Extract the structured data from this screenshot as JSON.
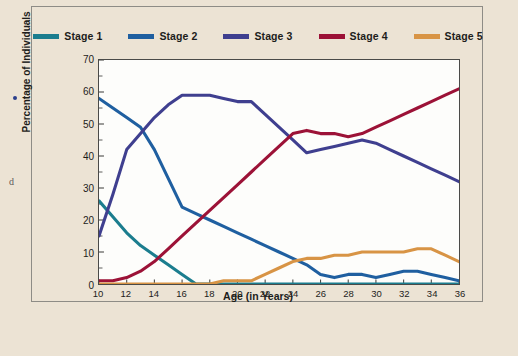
{
  "chart_data": {
    "type": "line",
    "title": "",
    "xlabel": "Age (in Years)",
    "ylabel": "Percentage of Individuals",
    "xlim": [
      10,
      36
    ],
    "ylim": [
      0,
      70
    ],
    "xticks": [
      10,
      12,
      14,
      16,
      18,
      20,
      22,
      24,
      26,
      28,
      30,
      32,
      34,
      36
    ],
    "yticks": [
      0,
      10,
      20,
      30,
      40,
      50,
      60,
      70
    ],
    "y_minor_tick_step": 5,
    "grid": false,
    "legend_position": "top",
    "x": [
      10,
      11,
      12,
      13,
      14,
      15,
      16,
      17,
      18,
      19,
      20,
      21,
      22,
      23,
      24,
      25,
      26,
      27,
      28,
      29,
      30,
      31,
      32,
      33,
      34,
      35,
      36
    ],
    "series": [
      {
        "name": "Stage 1",
        "color": "#1b7d8e",
        "values": [
          26,
          21,
          16,
          12,
          9,
          6,
          3,
          0,
          0,
          0,
          0,
          0,
          0,
          0,
          0,
          0,
          0,
          0,
          0,
          0,
          0,
          0,
          0,
          0,
          0,
          0,
          0
        ]
      },
      {
        "name": "Stage 2",
        "color": "#1f5fa0",
        "values": [
          58,
          55,
          52,
          49,
          42,
          33,
          24,
          22,
          20,
          18,
          16,
          14,
          12,
          10,
          8,
          6,
          3,
          2,
          3,
          3,
          2,
          3,
          4,
          4,
          3,
          2,
          1
        ]
      },
      {
        "name": "Stage 3",
        "color": "#3f3f8f",
        "values": [
          15,
          28,
          42,
          47,
          52,
          56,
          59,
          59,
          59,
          58,
          57,
          57,
          53,
          49,
          45,
          41,
          42,
          43,
          44,
          45,
          44,
          42,
          40,
          38,
          36,
          34,
          32
        ]
      },
      {
        "name": "Stage 4",
        "color": "#9c1237",
        "values": [
          1,
          1,
          2,
          4,
          7,
          11,
          15,
          19,
          23,
          27,
          31,
          35,
          39,
          43,
          47,
          48,
          47,
          47,
          46,
          47,
          49,
          51,
          53,
          55,
          57,
          59,
          61
        ]
      },
      {
        "name": "Stage 5",
        "color": "#d89445",
        "values": [
          0,
          0,
          0,
          0,
          0,
          0,
          0,
          0,
          0,
          1,
          1,
          1,
          3,
          5,
          7,
          8,
          8,
          9,
          9,
          10,
          10,
          10,
          10,
          11,
          11,
          9,
          7
        ]
      }
    ]
  },
  "legend": {
    "items": [
      {
        "label": "Stage 1"
      },
      {
        "label": "Stage 2"
      },
      {
        "label": "Stage 3"
      },
      {
        "label": "Stage 4"
      },
      {
        "label": "Stage 5"
      }
    ]
  },
  "axes": {
    "x_title": "Age (in Years)",
    "y_title": "Percentage of Individuals"
  },
  "artifacts": {
    "edge_glyph": "d"
  },
  "colors": {
    "page_background": "#ece3d4",
    "plot_background": "#fdfdfb",
    "frame_border": "#8e8c86",
    "axis_border": "#4a4a48",
    "text": "#1d1d1b"
  }
}
